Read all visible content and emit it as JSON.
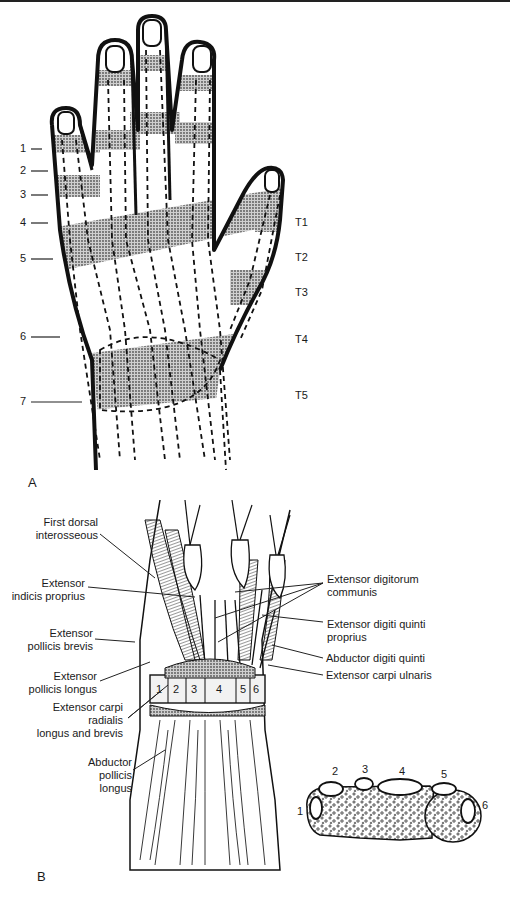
{
  "figure": {
    "panel_a": {
      "letter": "A",
      "left_labels": [
        "1",
        "2",
        "3",
        "4",
        "5",
        "6",
        "7"
      ],
      "right_labels": [
        "T1",
        "T2",
        "T3",
        "T4",
        "T5"
      ]
    },
    "panel_b": {
      "letter": "B",
      "left_labels": [
        {
          "line1": "First dorsal",
          "line2": "interosseous"
        },
        {
          "line1": "Extensor",
          "line2": "indicis proprius"
        },
        {
          "line1": "Extensor",
          "line2": "pollicis brevis"
        },
        {
          "line1": "Extensor",
          "line2": "pollicis longus"
        },
        {
          "line1": "Extensor carpi",
          "line2": "radialis",
          "line3": "longus and brevis"
        },
        {
          "line1": "Abductor",
          "line2": "pollicis",
          "line3": "longus"
        }
      ],
      "right_labels": [
        {
          "line1": "Extensor digitorum",
          "line2": "communis"
        },
        {
          "line1": "Extensor digiti quinti",
          "line2": "proprius"
        },
        {
          "line1": "Abductor digiti quinti"
        },
        {
          "line1": "Extensor carpi ulnaris"
        }
      ],
      "compartment_numbers": [
        "1",
        "2",
        "3",
        "4",
        "5",
        "6"
      ],
      "cross_section_numbers": [
        "1",
        "2",
        "3",
        "4",
        "5",
        "6"
      ]
    }
  }
}
